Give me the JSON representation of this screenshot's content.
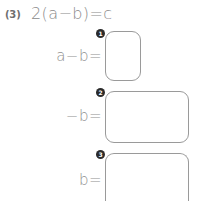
{
  "problem": {
    "number_label": "(3)",
    "equation": "2(a−b)=c"
  },
  "answer_rows": [
    {
      "label": "a−b=",
      "badge": "1",
      "value": "",
      "placeholder": ""
    },
    {
      "label": "−b=",
      "badge": "2",
      "value": "",
      "placeholder": ""
    },
    {
      "label": "b=",
      "badge": "3",
      "value": "",
      "placeholder": ""
    }
  ],
  "colors": {
    "text": "#8a8a8a",
    "box_border": "#9a9a9a",
    "badge_background": "#2b2b2b",
    "badge_text": "#ffffff",
    "page_background": "#ffffff"
  }
}
